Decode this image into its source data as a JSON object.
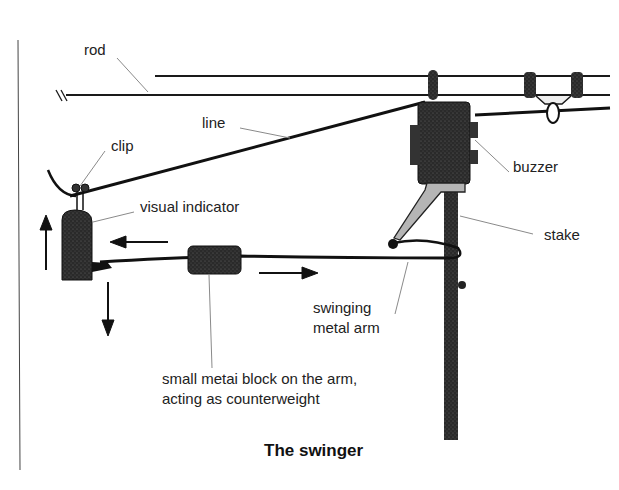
{
  "diagram": {
    "title": "The swinger",
    "labels": {
      "rod": "rod",
      "line": "line",
      "clip": "clip",
      "visual_indicator": "visual indicator",
      "buzzer": "buzzer",
      "stake": "stake",
      "swinging_metal_arm_1": "swinging",
      "swinging_metal_arm_2": "metal arm",
      "counterweight_1": "small metai block on the arm,",
      "counterweight_2": "acting as counterweight"
    },
    "colors": {
      "ink": "#1a1a1a",
      "body": "#2e2e2e",
      "leader": "#8a8a8a",
      "bracket": "#b5b5b5"
    }
  }
}
